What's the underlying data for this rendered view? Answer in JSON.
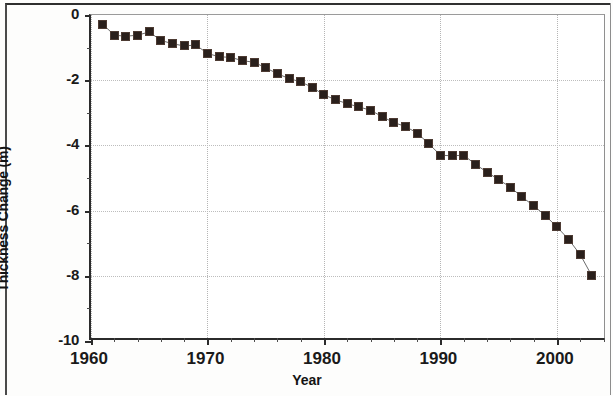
{
  "chart_data": {
    "type": "scatter",
    "title": "",
    "xlabel": "Year",
    "ylabel": "Cumulative\nThickness Change (m)",
    "ylabel_line1": "Cumulative",
    "ylabel_line2": "Thickness Change (m)",
    "xlim": [
      1960,
      2004.3
    ],
    "ylim": [
      -10,
      0
    ],
    "x_tick_labels": [
      "1960",
      "1970",
      "1980",
      "1990",
      "2000"
    ],
    "x_ticks": [
      1960,
      1970,
      1980,
      1990,
      2000
    ],
    "x_minor_tick_step": 2,
    "y_tick_labels": [
      "0",
      "-2",
      "-4",
      "-6",
      "-8",
      "-10"
    ],
    "y_ticks": [
      0,
      -2,
      -4,
      -6,
      -8,
      -10
    ],
    "grid": true,
    "grid_style": "dotted",
    "legend": null,
    "marker": "filled-square",
    "marker_color": "#2a201c",
    "line_color": "#6b6b6b",
    "x": [
      1961,
      1962,
      1963,
      1964,
      1965,
      1966,
      1967,
      1968,
      1969,
      1970,
      1971,
      1972,
      1973,
      1974,
      1975,
      1976,
      1977,
      1978,
      1979,
      1980,
      1981,
      1982,
      1983,
      1984,
      1985,
      1986,
      1987,
      1988,
      1989,
      1990,
      1991,
      1992,
      1993,
      1994,
      1995,
      1996,
      1997,
      1998,
      1999,
      2000,
      2001,
      2002,
      2003
    ],
    "values": [
      -0.28,
      -0.62,
      -0.65,
      -0.62,
      -0.52,
      -0.78,
      -0.88,
      -0.95,
      -0.92,
      -1.18,
      -1.28,
      -1.3,
      -1.4,
      -1.45,
      -1.62,
      -1.8,
      -1.95,
      -2.05,
      -2.22,
      -2.45,
      -2.6,
      -2.72,
      -2.82,
      -2.92,
      -3.12,
      -3.3,
      -3.42,
      -3.62,
      -3.95,
      -4.3,
      -4.32,
      -4.3,
      -4.58,
      -4.82,
      -5.05,
      -5.28,
      -5.58,
      -5.85,
      -6.15,
      -6.5,
      -6.88,
      -7.35,
      -8.0
    ],
    "series_name": "Cumulative Thickness Change"
  },
  "axes": {
    "y_title_line1": "Cumulative",
    "y_title_line2": "Thickness Change (m)",
    "x_title": "Year"
  }
}
